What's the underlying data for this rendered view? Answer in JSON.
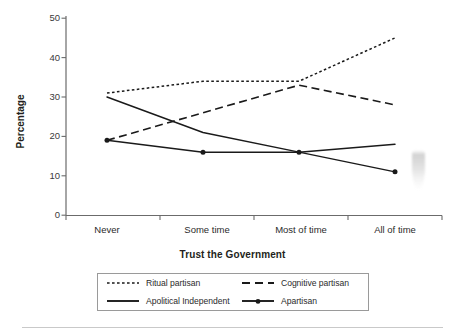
{
  "chart_data": {
    "type": "line",
    "title": "",
    "xlabel": "Trust the Government",
    "ylabel": "Percentage",
    "categories": [
      "Never",
      "Some time",
      "Most of time",
      "All of time"
    ],
    "ylim": [
      0,
      50
    ],
    "yticks": [
      0,
      10,
      20,
      30,
      40,
      50
    ],
    "grid": false,
    "legend_position": "below-axis",
    "series": [
      {
        "name": "Ritual partisan",
        "style": "dotted",
        "marker": "none",
        "color": "#1a1a1a",
        "values": [
          31,
          34,
          34,
          45
        ]
      },
      {
        "name": "Cognitive partisan",
        "style": "dashed",
        "marker": "none",
        "color": "#1a1a1a",
        "values": [
          19,
          26,
          33,
          28
        ]
      },
      {
        "name": "Apolitical Independent",
        "style": "solid",
        "marker": "none",
        "color": "#1a1a1a",
        "values": [
          30,
          21,
          16,
          18
        ]
      },
      {
        "name": "Apartisan",
        "style": "solid",
        "marker": "circle",
        "color": "#1a1a1a",
        "values": [
          19,
          16,
          16,
          11
        ]
      }
    ]
  },
  "axes": {
    "y_tick_labels": [
      "50",
      "40",
      "30",
      "20",
      "10",
      "0"
    ],
    "x_tick_labels": [
      "Never",
      "Some time",
      "Most of time",
      "All of time"
    ],
    "y_axis_title": "Percentage",
    "x_axis_title": "Trust the Government"
  },
  "legend": {
    "entries": [
      {
        "label": "Ritual partisan",
        "style": "dotted"
      },
      {
        "label": "Cognitive partisan",
        "style": "dashed"
      },
      {
        "label": "Apolitical Independent",
        "style": "solid"
      },
      {
        "label": "Apartisan",
        "style": "solid-marker"
      }
    ]
  },
  "colors": {
    "ink": "#1a1a1a",
    "axis": "#6b6b6b",
    "legend_border": "#9a9a9a",
    "background": "#ffffff"
  }
}
